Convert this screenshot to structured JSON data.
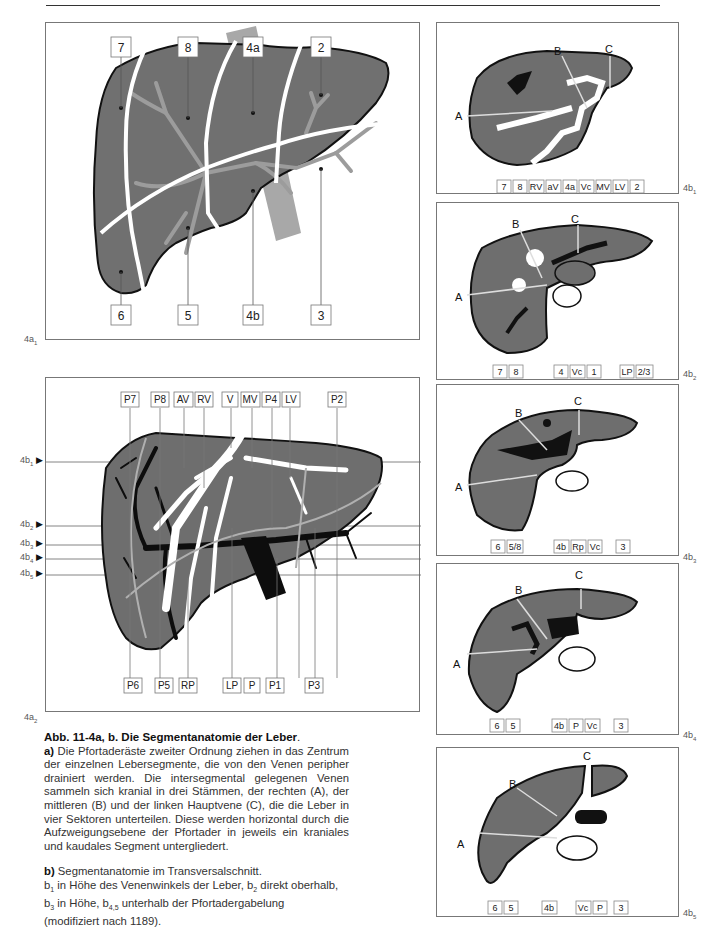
{
  "figure": {
    "id": "Abb. 11-4a, b",
    "title": "Abb. 11-4a, b. Die Segmentanatomie der Leber",
    "title_end": "."
  },
  "panels": {
    "a1": {
      "label": "4a",
      "label_sub": "1",
      "top_labels": [
        "7",
        "8",
        "4a",
        "2"
      ],
      "bottom_labels": [
        "6",
        "5",
        "4b",
        "3"
      ]
    },
    "a2": {
      "label": "4a",
      "label_sub": "2",
      "top_labels": [
        "P7",
        "P8",
        "AV",
        "RV",
        "V",
        "MV",
        "P4",
        "LV",
        "P2"
      ],
      "bottom_labels": [
        "P6",
        "P5",
        "RP",
        "LP",
        "P",
        "P1",
        "P3"
      ],
      "level_markers": [
        {
          "label": "4b",
          "sub": "1"
        },
        {
          "label": "4b",
          "sub": "2"
        },
        {
          "label": "4b",
          "sub": "3"
        },
        {
          "label": "4b",
          "sub": "4"
        },
        {
          "label": "4b",
          "sub": "5"
        }
      ]
    },
    "b1": {
      "label": "4b",
      "label_sub": "1",
      "vein_letters": [
        "A",
        "B",
        "C"
      ],
      "bottom_labels": [
        "7",
        "8",
        "RV",
        "aV",
        "4a",
        "Vc",
        "MV",
        "LV",
        "2"
      ]
    },
    "b2": {
      "label": "4b",
      "label_sub": "2",
      "vein_letters": [
        "A",
        "B",
        "C"
      ],
      "bottom_labels": [
        "7",
        "8",
        "4",
        "Vc",
        "1",
        "LP",
        "2/3"
      ]
    },
    "b3": {
      "label": "4b",
      "label_sub": "3",
      "vein_letters": [
        "A",
        "B",
        "C"
      ],
      "bottom_labels": [
        "6",
        "5/8",
        "4b",
        "Rp",
        "Vc",
        "3"
      ]
    },
    "b4": {
      "label": "4b",
      "label_sub": "4",
      "vein_letters": [
        "A",
        "B",
        "C"
      ],
      "bottom_labels": [
        "6",
        "5",
        "4b",
        "P",
        "Vc",
        "3"
      ]
    },
    "b5": {
      "label": "4b",
      "label_sub": "5",
      "vein_letters": [
        "A",
        "B",
        "C"
      ],
      "bottom_labels": [
        "6",
        "5",
        "4b",
        "Vc",
        "P",
        "3"
      ]
    }
  },
  "caption": {
    "a_marker": "a)",
    "a_text": "Die Pfortaderäste zweiter Ordnung ziehen in das Zentrum der einzelnen Lebersegmente, die von den Venen peripher drainiert werden. Die intersegmental gelegenen Venen sammeln sich kranial in drei Stämmen, der rechten (A), der mittleren (B) und der linken Hauptvene (C), die die Leber in vier Sektoren unterteilen. Diese werden horizontal durch die Aufzweigungsebene der Pfortader in jeweils ein kraniales und kaudales Segment untergliedert.",
    "b_marker": "b)",
    "b_text": "Segmentanatomie im Transversalschnitt.",
    "b_lines": [
      {
        "pre": "b",
        "sub": "1",
        "text": " in Höhe des Venenwinkels der Leber, "
      },
      {
        "pre": "b",
        "sub": "2",
        "text": " direkt oberhalb,"
      },
      {
        "pre": "b",
        "sub": "3",
        "text": " in Höhe, "
      },
      {
        "pre": "b",
        "sub": "4,5",
        "text": " unterhalb der Pfortadergabelung"
      }
    ],
    "b_end": "(modifiziert nach 1189)."
  },
  "colors": {
    "liver": "#6b6b6b",
    "liver_outline": "#111111",
    "vessel_light": "#9a9a9a",
    "vein_white": "#ffffff",
    "portal_black": "#0d0d0d",
    "frame": "#777777"
  }
}
